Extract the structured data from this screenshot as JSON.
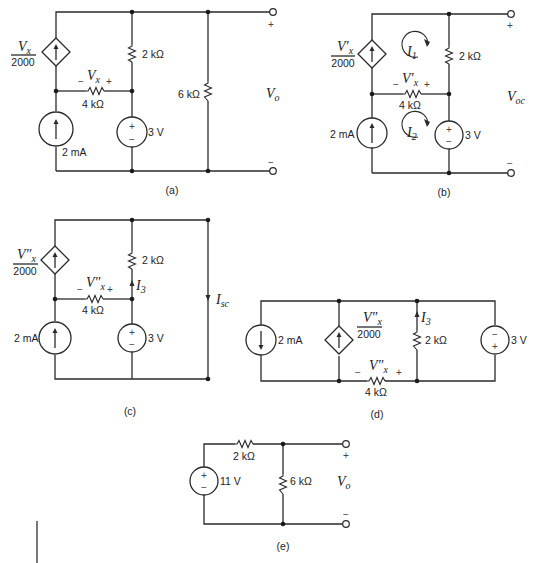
{
  "figure": {
    "subfigures": [
      {
        "id": "a",
        "caption": "(a)",
        "dependent_source": {
          "num": "V",
          "num_sub": "x",
          "den": "2000"
        },
        "resistor_top": "2 kΩ",
        "resistor_mid": "4 kΩ",
        "resistor_mid_voltage": {
          "var": "V",
          "sub": "x",
          "minus": "−",
          "plus": "+"
        },
        "resistor_load": "6 kΩ",
        "current_source": "2 mA",
        "voltage_source": "3 V",
        "vs_plus": "+",
        "vs_minus": "−",
        "output": {
          "var": "V",
          "sub": "o",
          "plus": "+",
          "minus": "−"
        }
      },
      {
        "id": "b",
        "caption": "(b)",
        "dependent_source": {
          "num": "V′",
          "num_sub": "x",
          "den": "2000"
        },
        "resistor_top": "2 kΩ",
        "resistor_mid": "4 kΩ",
        "resistor_mid_voltage": {
          "var": "V′",
          "sub": "x",
          "minus": "−",
          "plus": "+"
        },
        "mesh_currents": [
          {
            "var": "I",
            "sub": "1"
          },
          {
            "var": "I",
            "sub": "2"
          }
        ],
        "current_source": "2 mA",
        "voltage_source": "3 V",
        "vs_plus": "+",
        "vs_minus": "−",
        "output": {
          "var": "V",
          "sub": "oc",
          "plus": "+",
          "minus": "−"
        }
      },
      {
        "id": "c",
        "caption": "(c)",
        "dependent_source": {
          "num": "V″",
          "num_sub": "x",
          "den": "2000"
        },
        "resistor_top": "2 kΩ",
        "resistor_mid": "4 kΩ",
        "resistor_mid_voltage": {
          "var": "V″",
          "sub": "x",
          "minus": "−",
          "plus": "+"
        },
        "branch_current": {
          "var": "I",
          "sub": "3"
        },
        "short_current": {
          "var": "I",
          "sub": "sc"
        },
        "current_source": "2 mA",
        "voltage_source": "3 V",
        "vs_plus": "+",
        "vs_minus": "−"
      },
      {
        "id": "d",
        "caption": "(d)",
        "dependent_source": {
          "num": "V″",
          "num_sub": "x",
          "den": "2000"
        },
        "resistor_branch": "2 kΩ",
        "resistor_bottom": "4 kΩ",
        "resistor_bottom_voltage": {
          "var": "V″",
          "sub": "x",
          "minus": "−",
          "plus": "+"
        },
        "branch_current": {
          "var": "I",
          "sub": "3"
        },
        "current_source": "2 mA",
        "voltage_source": "3 V",
        "vs_plus": "+",
        "vs_minus": "−"
      },
      {
        "id": "e",
        "caption": "(e)",
        "voltage_source": "11 V",
        "vs_plus": "+",
        "vs_minus": "−",
        "resistor_series": "2 kΩ",
        "resistor_load": "6 kΩ",
        "output": {
          "var": "V",
          "sub": "o",
          "plus": "+",
          "minus": "−"
        }
      }
    ]
  }
}
